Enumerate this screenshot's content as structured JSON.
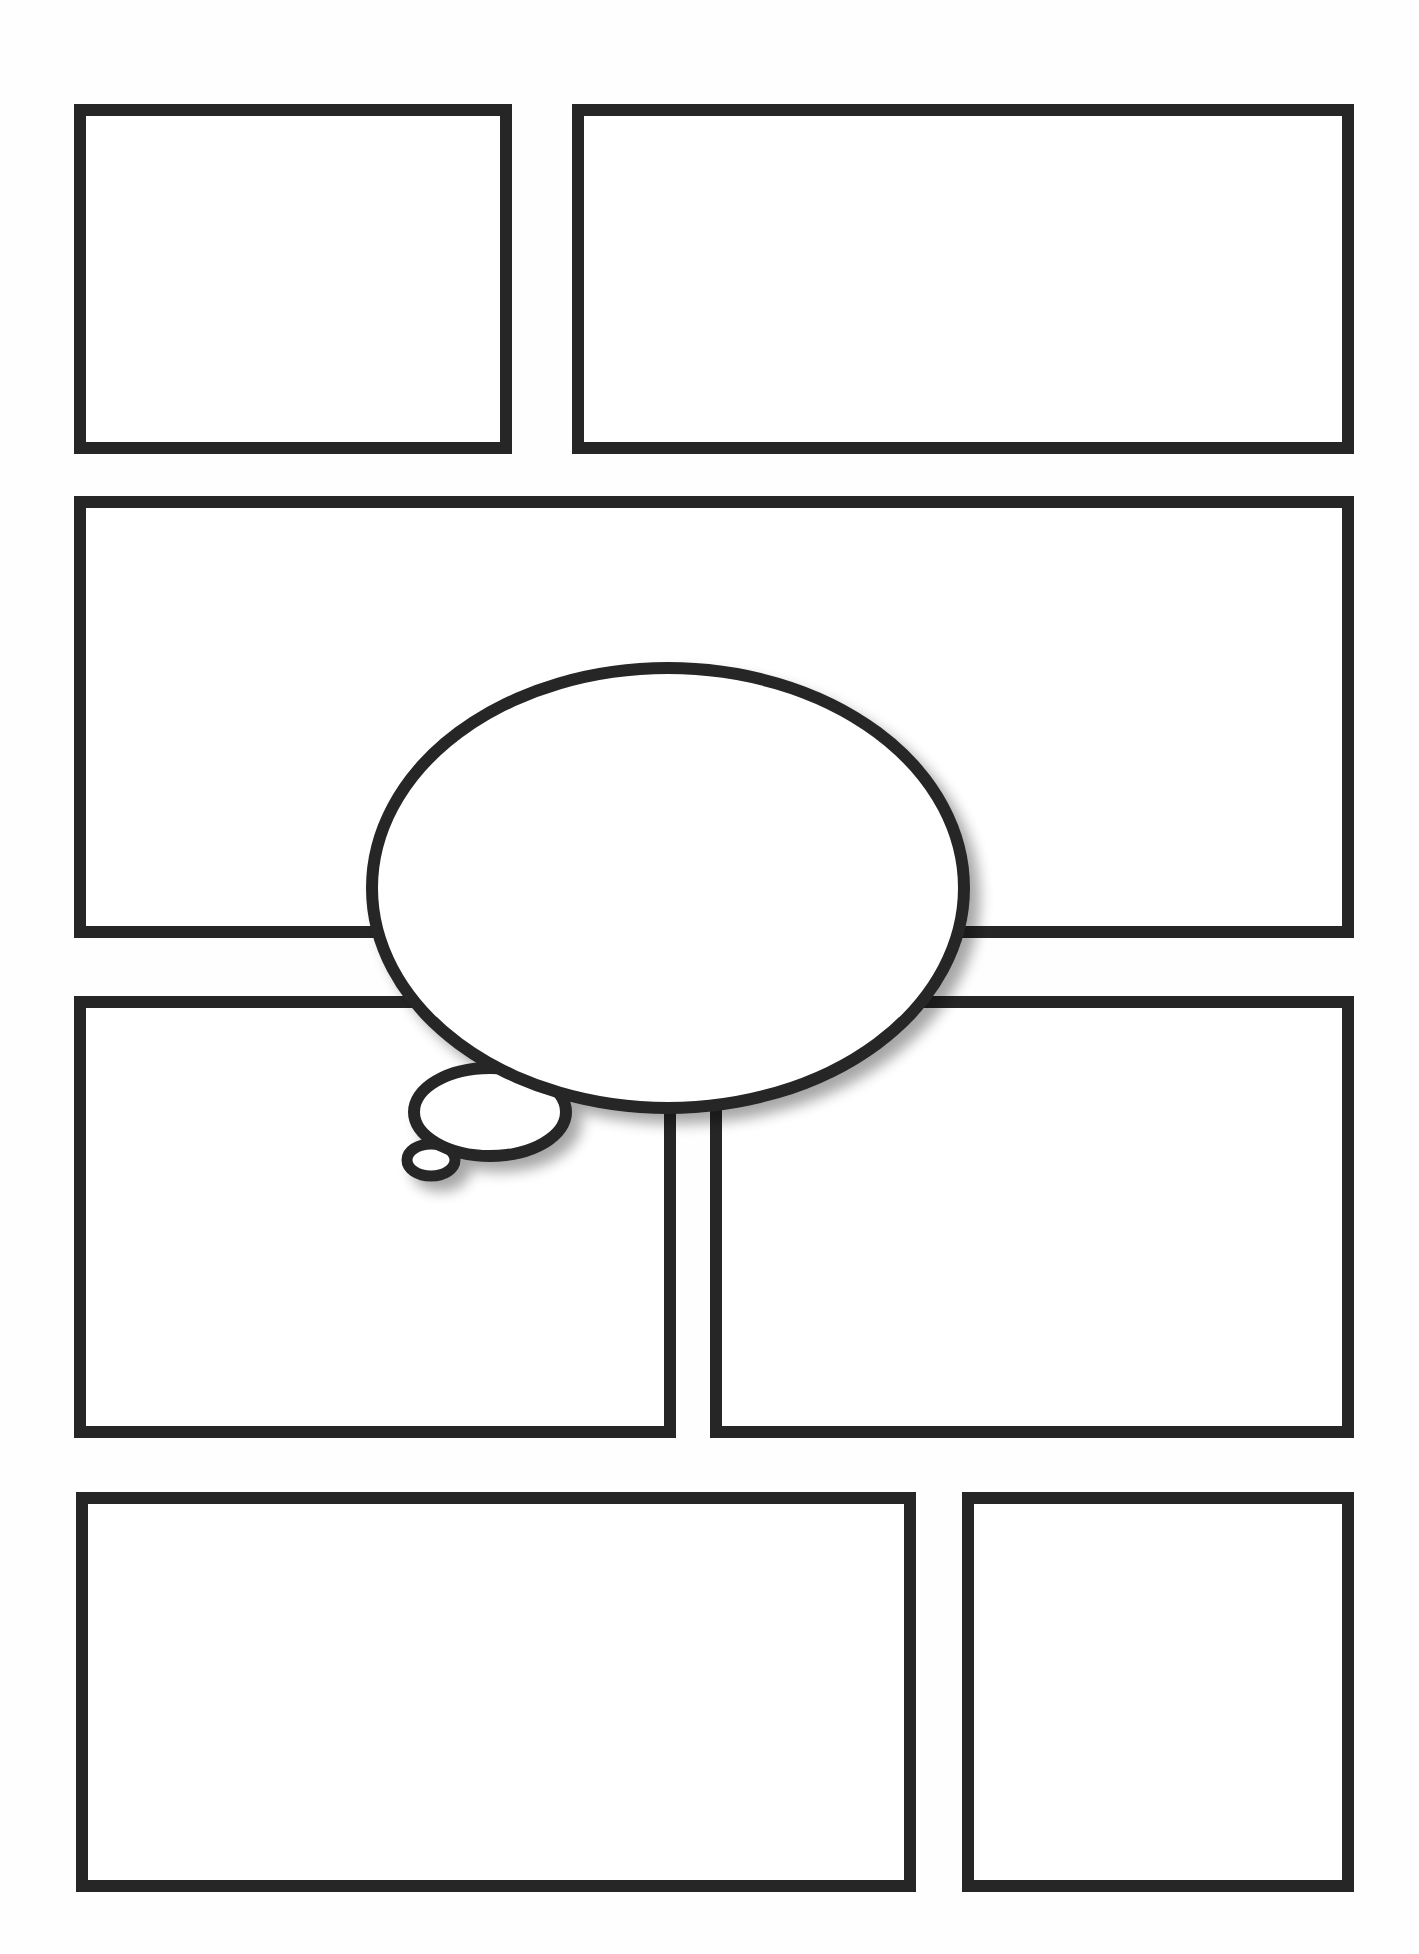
{
  "page": {
    "width": 1419,
    "height": 1954,
    "background": "#fefefe",
    "stroke_color": "#262626",
    "stroke_width": 12,
    "note": "All geometry below is approximate; coordinates were estimated from zoomed crops whose effective scale was not exactly 3x."
  },
  "panels": [
    {
      "id": "panel-1",
      "row": 1,
      "x": 74,
      "y": 104,
      "w": 438,
      "h": 350
    },
    {
      "id": "panel-2",
      "row": 1,
      "x": 572,
      "y": 104,
      "w": 782,
      "h": 350
    },
    {
      "id": "panel-3",
      "row": 2,
      "x": 74,
      "y": 496,
      "w": 1280,
      "h": 442
    },
    {
      "id": "panel-4",
      "row": 3,
      "x": 74,
      "y": 996,
      "w": 602,
      "h": 442
    },
    {
      "id": "panel-5",
      "row": 3,
      "x": 710,
      "y": 996,
      "w": 644,
      "h": 442
    },
    {
      "id": "panel-6",
      "row": 4,
      "x": 76,
      "y": 1492,
      "w": 840,
      "h": 400
    },
    {
      "id": "panel-7",
      "row": 4,
      "x": 962,
      "y": 1492,
      "w": 392,
      "h": 400
    }
  ],
  "thought_bubble": {
    "main": {
      "cx": 668,
      "cy": 888,
      "rx": 296,
      "ry": 220
    },
    "tail_large": {
      "cx": 490,
      "cy": 1112,
      "rx": 76,
      "ry": 44
    },
    "tail_small": {
      "cx": 431,
      "cy": 1160,
      "rx": 24,
      "ry": 16
    },
    "shadow_color": "rgba(0,0,0,0.28)"
  }
}
